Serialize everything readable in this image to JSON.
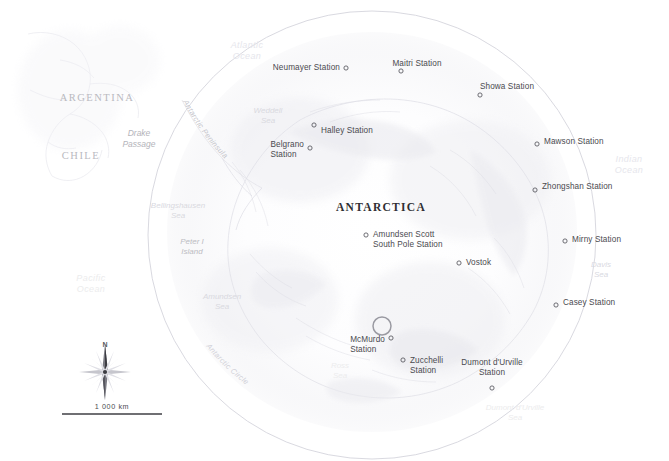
{
  "map": {
    "title": "ANTARCTICA",
    "title_pos": [
      381,
      207
    ],
    "projection": "polar-stereographic",
    "background_color": "#ffffff",
    "circle": {
      "label": "Antarctic Circle",
      "center": [
        372,
        235
      ],
      "radius": 224,
      "stroke": "#d5d5dc"
    },
    "highlight": {
      "name": "mcmurdo-highlight-ring",
      "center": [
        382,
        326
      ],
      "radius": 9,
      "stroke": "#9a9aa2"
    }
  },
  "stations": [
    {
      "name": "Neumayer Station",
      "label": "Neumayer Station",
      "marker": [
        346,
        68
      ],
      "label_pos": [
        340,
        68
      ],
      "anchor": "right",
      "lines": [
        "Neumayer Station"
      ]
    },
    {
      "name": "Maitri Station",
      "label": "Maitri Station",
      "marker": [
        401,
        71
      ],
      "label_pos": [
        417,
        64
      ],
      "anchor": "center",
      "lines": [
        "Maitri Station"
      ]
    },
    {
      "name": "Showa Station",
      "label": "Showa Station",
      "marker": [
        480,
        95
      ],
      "label_pos": [
        507,
        87
      ],
      "anchor": "center",
      "lines": [
        "Showa Station"
      ]
    },
    {
      "name": "Mawson Station",
      "label": "Mawson Station",
      "marker": [
        537,
        144
      ],
      "label_pos": [
        544,
        142
      ],
      "anchor": "left",
      "lines": [
        "Mawson Station"
      ]
    },
    {
      "name": "Zhongshan Station",
      "label": "Zhongshan Station",
      "marker": [
        535,
        190
      ],
      "label_pos": [
        542,
        187
      ],
      "anchor": "left",
      "lines": [
        "Zhongshan Station"
      ]
    },
    {
      "name": "Mirny Station",
      "label": "Mirny Station",
      "marker": [
        565,
        241
      ],
      "label_pos": [
        572,
        240
      ],
      "anchor": "left",
      "lines": [
        "Mirny Station"
      ]
    },
    {
      "name": "Casey Station",
      "label": "Casey Station",
      "marker": [
        556,
        305
      ],
      "label_pos": [
        563,
        303
      ],
      "anchor": "left",
      "lines": [
        "Casey Station"
      ]
    },
    {
      "name": "Halley Station",
      "label": "Halley Station",
      "marker": [
        314,
        125
      ],
      "label_pos": [
        321,
        131
      ],
      "anchor": "left",
      "lines": [
        "Halley Station"
      ]
    },
    {
      "name": "Belgrano Station",
      "label": "Belgrano Station",
      "marker": [
        310,
        148
      ],
      "label_pos": [
        304,
        150
      ],
      "anchor": "right",
      "lines": [
        "Belgrano",
        "Station"
      ]
    },
    {
      "name": "Amundsen Scott South Pole Station",
      "label": "Amundsen Scott South Pole Station",
      "marker": [
        366,
        235
      ],
      "label_pos": [
        373,
        240
      ],
      "anchor": "left",
      "lines": [
        "Amundsen Scott",
        "South Pole Station"
      ]
    },
    {
      "name": "Vostok",
      "label": "Vostok",
      "marker": [
        459,
        263
      ],
      "label_pos": [
        466,
        263
      ],
      "anchor": "left",
      "lines": [
        "Vostok"
      ]
    },
    {
      "name": "McMurdo Station",
      "label": "McMurdo Station",
      "marker": [
        391,
        338
      ],
      "label_pos": [
        385,
        345
      ],
      "anchor": "right",
      "lines": [
        "McMurdo",
        "Station"
      ]
    },
    {
      "name": "Zucchelli Station",
      "label": "Zucchelli Station",
      "marker": [
        403,
        360
      ],
      "label_pos": [
        410,
        366
      ],
      "anchor": "left",
      "lines": [
        "Zucchelli",
        "Station"
      ]
    },
    {
      "name": "Dumont d'Urville Station",
      "label": "Dumont d'Urville Station",
      "marker": [
        492,
        388
      ],
      "label_pos": [
        492,
        377
      ],
      "anchor": "cbot",
      "lines": [
        "Dumont d'Urville",
        "Station"
      ]
    }
  ],
  "countries": [
    {
      "name": "ARGENTINA",
      "pos": [
        97,
        98
      ]
    },
    {
      "name": "CHILE",
      "pos": [
        81,
        156
      ]
    }
  ],
  "water_labels": [
    {
      "name": "Atlantic Ocean",
      "lines": [
        "Atlantic",
        "Ocean"
      ],
      "pos": [
        247,
        51
      ],
      "style": "ocean-major"
    },
    {
      "name": "Indian Ocean",
      "lines": [
        "Indian",
        "Ocean"
      ],
      "pos": [
        629,
        165
      ],
      "style": "ocean-major"
    },
    {
      "name": "Pacific Ocean",
      "lines": [
        "Pacific",
        "Ocean"
      ],
      "pos": [
        91,
        284
      ],
      "style": "ocean-major very-faint"
    },
    {
      "name": "Weddell Sea",
      "lines": [
        "Weddell",
        "Sea"
      ],
      "pos": [
        268,
        116
      ],
      "style": ""
    },
    {
      "name": "Davis Sea",
      "lines": [
        "Davis",
        "Sea"
      ],
      "pos": [
        601,
        270
      ],
      "style": ""
    },
    {
      "name": "Ross Sea",
      "lines": [
        "Ross",
        "Sea"
      ],
      "pos": [
        340,
        371
      ],
      "style": "very-faint"
    },
    {
      "name": "Bellingshausen Sea",
      "lines": [
        "Bellingshausen",
        "Sea"
      ],
      "pos": [
        178,
        211
      ],
      "style": ""
    },
    {
      "name": "Amundsen Sea",
      "lines": [
        "Amundsen",
        "Sea"
      ],
      "pos": [
        222,
        302
      ],
      "style": ""
    },
    {
      "name": "Dumont d'Urville Sea",
      "lines": [
        "Dumont d'Urville",
        "Sea"
      ],
      "pos": [
        515,
        413
      ],
      "style": "very-faint"
    },
    {
      "name": "Drake Passage",
      "lines": [
        "Drake",
        "Passage"
      ],
      "pos": [
        139,
        139
      ],
      "style": "drake"
    },
    {
      "name": "Peter I Island",
      "lines": [
        "Peter I",
        "Island"
      ],
      "pos": [
        192,
        247
      ],
      "style": "peter"
    }
  ],
  "curved_labels": [
    {
      "name": "Antarctic Peninsula",
      "text": "Antarctic Peninsula",
      "color": "#c6c6cc"
    },
    {
      "name": "Antarctic Circle",
      "text": "Antarctic Circle",
      "color": "#d2d2d9"
    }
  ],
  "compass": {
    "north_label": "N",
    "center": [
      105,
      372
    ],
    "label_pos": [
      105,
      344
    ]
  },
  "scale_bar": {
    "label": "1 000 km",
    "label_pos": [
      112,
      406
    ],
    "x1": 62,
    "x2": 162,
    "y": 414
  },
  "colors": {
    "ice": "#fcfcfd",
    "coast": "#e4e4ea",
    "circle": "#d5d5dc",
    "marker": "#55555c",
    "text": "#4a4a4f",
    "highlight": "#9a9aa2"
  }
}
